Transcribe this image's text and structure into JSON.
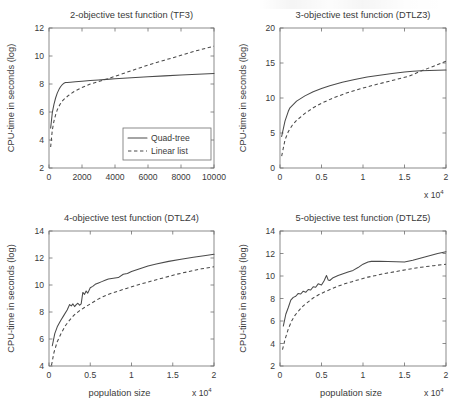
{
  "figure": {
    "name": "cpu-time-vs-population-size",
    "background": "#ffffff",
    "line_color": "#4a4a4a",
    "axis_color": "#6f6f6f",
    "panel_count": 4
  },
  "legend": {
    "position": "lower-right of top-left panel",
    "entries": [
      {
        "label": "Quad-tree",
        "style": "solid"
      },
      {
        "label": "Linear list",
        "style": "dashed"
      }
    ]
  },
  "chart_data": [
    {
      "id": "tf3",
      "type": "line",
      "title": "2-objective test function (TF3)",
      "xlabel": "",
      "ylabel": "CPU-time in seconds (log)",
      "xlim": [
        0,
        10000
      ],
      "ylim": [
        2,
        12
      ],
      "xticks": [
        0,
        2000,
        4000,
        6000,
        8000,
        10000
      ],
      "xticklabels": [
        "0",
        "2000",
        "4000",
        "6000",
        "8000",
        "10000"
      ],
      "yticks": [
        2,
        4,
        6,
        8,
        10,
        12
      ],
      "yticklabels": [
        "2",
        "4",
        "6",
        "8",
        "10",
        "12"
      ],
      "exponent_label": "",
      "grid": false,
      "has_legend": true,
      "series": [
        {
          "name": "Quad-tree",
          "style": "solid",
          "x": [
            100,
            200,
            300,
            400,
            500,
            600,
            700,
            800,
            900,
            1000,
            1100,
            1300,
            1600,
            2000,
            2500,
            3000,
            3500,
            4000,
            5000,
            6000,
            7000,
            8000,
            9000,
            10000
          ],
          "y": [
            4.85,
            5.95,
            6.55,
            7.0,
            7.35,
            7.6,
            7.8,
            7.95,
            8.05,
            8.1,
            8.11,
            8.13,
            8.16,
            8.2,
            8.25,
            8.29,
            8.33,
            8.37,
            8.45,
            8.52,
            8.58,
            8.64,
            8.7,
            8.75
          ]
        },
        {
          "name": "Linear list",
          "style": "dashed",
          "x": [
            100,
            200,
            300,
            400,
            500,
            600,
            700,
            800,
            900,
            1000,
            1200,
            1500,
            2000,
            2500,
            3000,
            3300,
            3500,
            4000,
            5000,
            6000,
            7000,
            8000,
            9000,
            10000
          ],
          "y": [
            3.5,
            4.7,
            5.35,
            5.8,
            6.15,
            6.4,
            6.6,
            6.78,
            6.9,
            7.0,
            7.2,
            7.45,
            7.75,
            8.0,
            8.18,
            8.28,
            8.35,
            8.55,
            8.95,
            9.35,
            9.7,
            10.05,
            10.4,
            10.7
          ]
        }
      ]
    },
    {
      "id": "dtlz3",
      "type": "line",
      "title": "3-objective test function (DTLZ3)",
      "xlabel": "",
      "ylabel": "CPU-time in seconds (log)",
      "xlim": [
        0,
        2
      ],
      "ylim": [
        0,
        20
      ],
      "xticks": [
        0,
        0.5,
        1,
        1.5,
        2
      ],
      "xticklabels": [
        "0",
        "0.5",
        "1",
        "1.5",
        "2"
      ],
      "yticks": [
        0,
        5,
        10,
        15,
        20
      ],
      "yticklabels": [
        "0",
        "5",
        "10",
        "15",
        "20"
      ],
      "exponent_label": "x 10",
      "exponent_power": "4",
      "grid": false,
      "has_legend": false,
      "series": [
        {
          "name": "Quad-tree",
          "style": "solid",
          "x": [
            0.02,
            0.06,
            0.1,
            0.12,
            0.2,
            0.3,
            0.4,
            0.5,
            0.6,
            0.75,
            0.9,
            1.05,
            1.2,
            1.35,
            1.5,
            1.6,
            1.7,
            1.8,
            1.9,
            2.0
          ],
          "y": [
            4.5,
            6.7,
            8.1,
            8.6,
            9.55,
            10.3,
            10.9,
            11.35,
            11.75,
            12.25,
            12.65,
            13.0,
            13.25,
            13.5,
            13.72,
            13.82,
            13.88,
            13.92,
            13.96,
            14.0
          ]
        },
        {
          "name": "Linear list",
          "style": "dashed",
          "x": [
            0.02,
            0.06,
            0.1,
            0.15,
            0.2,
            0.3,
            0.4,
            0.5,
            0.65,
            0.8,
            0.95,
            1.1,
            1.25,
            1.4,
            1.55,
            1.7,
            1.85,
            2.0
          ],
          "y": [
            1.7,
            4.0,
            5.2,
            6.15,
            6.8,
            7.8,
            8.6,
            9.25,
            10.05,
            10.7,
            11.25,
            11.75,
            12.2,
            12.65,
            13.1,
            13.85,
            14.55,
            15.25
          ]
        }
      ]
    },
    {
      "id": "dtlz4",
      "type": "line",
      "title": "4-objective test function (DTLZ4)",
      "xlabel": "population size",
      "ylabel": "CPU-time in seconds (log)",
      "xlim": [
        0,
        2
      ],
      "ylim": [
        4,
        14
      ],
      "xticks": [
        0,
        0.5,
        1,
        1.5,
        2
      ],
      "xticklabels": [
        "0",
        "0.5",
        "1",
        "1.5",
        "2"
      ],
      "yticks": [
        4,
        6,
        8,
        10,
        12,
        14
      ],
      "yticklabels": [
        "4",
        "6",
        "8",
        "10",
        "12",
        "14"
      ],
      "exponent_label": "x 10",
      "exponent_power": "4",
      "grid": false,
      "has_legend": false,
      "series": [
        {
          "name": "Quad-tree",
          "style": "solid",
          "x": [
            0.04,
            0.07,
            0.1,
            0.14,
            0.18,
            0.22,
            0.25,
            0.27,
            0.29,
            0.31,
            0.33,
            0.35,
            0.37,
            0.39,
            0.41,
            0.43,
            0.45,
            0.47,
            0.5,
            0.53,
            0.56,
            0.6,
            0.64,
            0.68,
            0.72,
            0.78,
            0.84,
            0.9,
            0.95,
            1.0,
            1.1,
            1.2,
            1.3,
            1.45,
            1.6,
            1.75,
            1.9,
            2.0
          ],
          "y": [
            5.5,
            6.4,
            6.9,
            7.35,
            7.75,
            8.15,
            8.55,
            8.45,
            8.6,
            8.4,
            8.55,
            8.65,
            8.5,
            8.6,
            9.45,
            9.3,
            9.55,
            9.4,
            9.8,
            9.9,
            10.05,
            10.15,
            10.25,
            10.35,
            10.45,
            10.5,
            10.55,
            10.8,
            10.85,
            11.0,
            11.2,
            11.4,
            11.55,
            11.75,
            11.9,
            12.05,
            12.18,
            12.28
          ]
        },
        {
          "name": "Linear list",
          "style": "dashed",
          "x": [
            0.03,
            0.06,
            0.1,
            0.15,
            0.2,
            0.25,
            0.3,
            0.36,
            0.42,
            0.5,
            0.58,
            0.66,
            0.74,
            0.84,
            0.94,
            1.04,
            1.16,
            1.28,
            1.4,
            1.55,
            1.7,
            1.85,
            2.0
          ],
          "y": [
            4.05,
            5.0,
            5.8,
            6.45,
            7.0,
            7.4,
            7.75,
            8.05,
            8.3,
            8.6,
            8.9,
            9.15,
            9.35,
            9.55,
            9.75,
            9.95,
            10.15,
            10.35,
            10.55,
            10.8,
            11.0,
            11.2,
            11.35
          ]
        }
      ]
    },
    {
      "id": "dtlz5",
      "type": "line",
      "title": "5-objective test function (DTLZ5)",
      "xlabel": "population size",
      "ylabel": "CPU-time in seconds (log)",
      "xlim": [
        0,
        2
      ],
      "ylim": [
        2,
        14
      ],
      "xticks": [
        0,
        0.5,
        1,
        1.5,
        2
      ],
      "xticklabels": [
        "0",
        "0.5",
        "1",
        "1.5",
        "2"
      ],
      "yticks": [
        2,
        4,
        6,
        8,
        10,
        12,
        14
      ],
      "yticklabels": [
        "2",
        "4",
        "6",
        "8",
        "10",
        "12",
        "14"
      ],
      "exponent_label": "x 10",
      "exponent_power": "4",
      "grid": false,
      "has_legend": false,
      "series": [
        {
          "name": "Quad-tree",
          "style": "solid",
          "x": [
            0.04,
            0.07,
            0.1,
            0.13,
            0.16,
            0.19,
            0.22,
            0.25,
            0.28,
            0.31,
            0.34,
            0.37,
            0.4,
            0.43,
            0.46,
            0.5,
            0.53,
            0.56,
            0.58,
            0.6,
            0.64,
            0.7,
            0.76,
            0.82,
            0.88,
            0.94,
            1.0,
            1.06,
            1.1,
            1.2,
            1.3,
            1.4,
            1.5,
            1.6,
            1.7,
            1.8,
            1.9,
            2.0
          ],
          "y": [
            5.55,
            6.6,
            7.2,
            7.85,
            8.1,
            8.2,
            8.45,
            8.4,
            8.65,
            8.55,
            8.8,
            8.75,
            9.05,
            9.0,
            9.3,
            9.2,
            9.55,
            10.05,
            9.65,
            9.6,
            9.85,
            10.05,
            10.2,
            10.35,
            10.5,
            10.75,
            11.05,
            11.25,
            11.3,
            11.3,
            11.28,
            11.27,
            11.25,
            11.4,
            11.6,
            11.8,
            12.0,
            12.15
          ]
        },
        {
          "name": "Linear list",
          "style": "dashed",
          "x": [
            0.03,
            0.06,
            0.1,
            0.14,
            0.18,
            0.23,
            0.28,
            0.34,
            0.4,
            0.47,
            0.54,
            0.62,
            0.7,
            0.78,
            0.87,
            0.96,
            1.06,
            1.16,
            1.28,
            1.4,
            1.55,
            1.7,
            1.85,
            2.0
          ],
          "y": [
            3.45,
            4.35,
            5.3,
            6.0,
            6.5,
            6.95,
            7.35,
            7.7,
            8.05,
            8.35,
            8.6,
            8.85,
            9.1,
            9.3,
            9.5,
            9.7,
            9.9,
            10.05,
            10.25,
            10.4,
            10.6,
            10.78,
            10.92,
            11.05
          ]
        }
      ]
    }
  ]
}
